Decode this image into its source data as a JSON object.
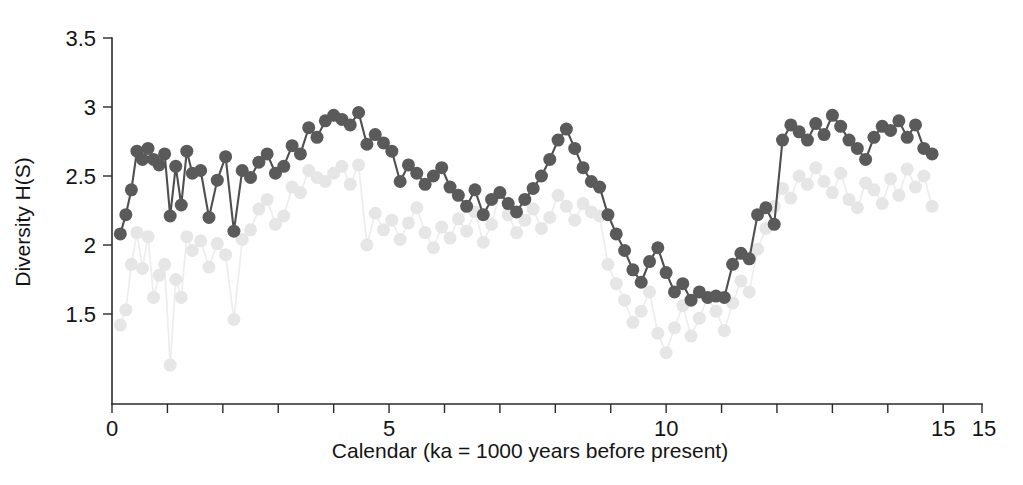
{
  "figure": {
    "title": "",
    "background_color": "#ffffff"
  },
  "axes": {
    "y_title": "Diversity H(S)",
    "x_title": "Calendar (ka = 1000 years before present)",
    "y_ticks": [
      "1.5",
      "2",
      "2.5",
      "3",
      "3.5"
    ],
    "x_ticks": [
      "0",
      "5",
      "10",
      "15",
      "15"
    ]
  },
  "chart_data": {
    "type": "scatter",
    "title": "",
    "xlabel": "Calendar (ka = 1000 years before present)",
    "ylabel": "Diversity H(S)",
    "xlim": [
      0,
      15.7
    ],
    "ylim": [
      1.05,
      3.5
    ],
    "x_tick_values": [
      0,
      1,
      2,
      3,
      4,
      5,
      6,
      7,
      8,
      9,
      10,
      11,
      12,
      13,
      14,
      15
    ],
    "x_tick_labels": [
      "0",
      "",
      "",
      "",
      "",
      "5",
      "",
      "",
      "",
      "",
      "10",
      "",
      "",
      "",
      "",
      "15"
    ],
    "x_extra_tick_label": "15",
    "y_tick_values": [
      1.5,
      2.0,
      2.5,
      3.0,
      3.5
    ],
    "y_tick_labels": [
      "1.5",
      "2",
      "2.5",
      "3",
      "3.5"
    ],
    "grid": false,
    "legend": "none",
    "marker": "circle",
    "marker_size": 13,
    "connected": true,
    "series": [
      {
        "name": "secondary-diversity",
        "color": "#e6e6e6",
        "line_color": "#ededed",
        "zorder": 1,
        "x": [
          0.15,
          0.25,
          0.35,
          0.45,
          0.55,
          0.65,
          0.75,
          0.85,
          0.95,
          1.05,
          1.15,
          1.25,
          1.35,
          1.45,
          1.6,
          1.75,
          1.9,
          2.05,
          2.2,
          2.35,
          2.5,
          2.65,
          2.8,
          2.95,
          3.1,
          3.25,
          3.4,
          3.55,
          3.7,
          3.85,
          4.0,
          4.15,
          4.3,
          4.45,
          4.6,
          4.75,
          4.9,
          5.05,
          5.2,
          5.35,
          5.5,
          5.65,
          5.8,
          5.95,
          6.1,
          6.25,
          6.4,
          6.55,
          6.7,
          6.85,
          7.0,
          7.15,
          7.3,
          7.45,
          7.6,
          7.75,
          7.9,
          8.05,
          8.2,
          8.35,
          8.5,
          8.65,
          8.8,
          8.95,
          9.1,
          9.25,
          9.4,
          9.55,
          9.7,
          9.85,
          10.0,
          10.15,
          10.3,
          10.45,
          10.6,
          10.75,
          10.9,
          11.05,
          11.2,
          11.35,
          11.5,
          11.65,
          11.8,
          11.95,
          12.1,
          12.25,
          12.4,
          12.55,
          12.7,
          12.85,
          13.0,
          13.15,
          13.3,
          13.45,
          13.6,
          13.75,
          13.9,
          14.05,
          14.2,
          14.35,
          14.5,
          14.65,
          14.8
        ],
        "y": [
          1.42,
          1.53,
          1.86,
          2.09,
          1.83,
          2.06,
          1.62,
          1.78,
          1.86,
          1.13,
          1.75,
          1.62,
          2.06,
          1.96,
          2.03,
          1.84,
          2.01,
          1.93,
          1.46,
          2.04,
          2.11,
          2.26,
          2.33,
          2.15,
          2.21,
          2.42,
          2.38,
          2.54,
          2.49,
          2.46,
          2.52,
          2.57,
          2.44,
          2.58,
          2.0,
          2.23,
          2.11,
          2.18,
          2.04,
          2.16,
          2.27,
          2.09,
          1.98,
          2.13,
          2.05,
          2.19,
          2.1,
          2.24,
          2.02,
          2.15,
          2.38,
          2.22,
          2.09,
          2.18,
          2.26,
          2.12,
          2.2,
          2.36,
          2.28,
          2.18,
          2.3,
          2.24,
          2.21,
          1.86,
          1.72,
          1.6,
          1.44,
          1.52,
          1.66,
          1.36,
          1.22,
          1.4,
          1.56,
          1.34,
          1.47,
          1.62,
          1.52,
          1.38,
          1.58,
          1.74,
          1.66,
          1.97,
          2.12,
          2.28,
          2.41,
          2.34,
          2.5,
          2.44,
          2.56,
          2.46,
          2.38,
          2.52,
          2.33,
          2.27,
          2.45,
          2.4,
          2.3,
          2.48,
          2.36,
          2.55,
          2.42,
          2.5,
          2.28
        ]
      },
      {
        "name": "primary-diversity",
        "color": "#5a5a5a",
        "line_color": "#4f4f4f",
        "zorder": 2,
        "x": [
          0.15,
          0.25,
          0.35,
          0.45,
          0.55,
          0.65,
          0.75,
          0.85,
          0.95,
          1.05,
          1.15,
          1.25,
          1.35,
          1.45,
          1.6,
          1.75,
          1.9,
          2.05,
          2.2,
          2.35,
          2.5,
          2.65,
          2.8,
          2.95,
          3.1,
          3.25,
          3.4,
          3.55,
          3.7,
          3.85,
          4.0,
          4.15,
          4.3,
          4.45,
          4.6,
          4.75,
          4.9,
          5.05,
          5.2,
          5.35,
          5.5,
          5.65,
          5.8,
          5.95,
          6.1,
          6.25,
          6.4,
          6.55,
          6.7,
          6.85,
          7.0,
          7.15,
          7.3,
          7.45,
          7.6,
          7.75,
          7.9,
          8.05,
          8.2,
          8.35,
          8.5,
          8.65,
          8.8,
          8.95,
          9.1,
          9.25,
          9.4,
          9.55,
          9.7,
          9.85,
          10.0,
          10.15,
          10.3,
          10.45,
          10.6,
          10.75,
          10.9,
          11.05,
          11.2,
          11.35,
          11.5,
          11.65,
          11.8,
          11.95,
          12.1,
          12.25,
          12.4,
          12.55,
          12.7,
          12.85,
          13.0,
          13.15,
          13.3,
          13.45,
          13.6,
          13.75,
          13.9,
          14.05,
          14.2,
          14.35,
          14.5,
          14.65,
          14.8
        ],
        "y": [
          2.08,
          2.22,
          2.4,
          2.68,
          2.62,
          2.7,
          2.62,
          2.58,
          2.66,
          2.21,
          2.57,
          2.29,
          2.68,
          2.52,
          2.54,
          2.2,
          2.47,
          2.64,
          2.1,
          2.54,
          2.49,
          2.6,
          2.66,
          2.52,
          2.57,
          2.72,
          2.66,
          2.85,
          2.78,
          2.9,
          2.94,
          2.91,
          2.87,
          2.96,
          2.73,
          2.8,
          2.74,
          2.68,
          2.46,
          2.58,
          2.52,
          2.44,
          2.5,
          2.56,
          2.42,
          2.36,
          2.28,
          2.4,
          2.22,
          2.33,
          2.38,
          2.3,
          2.24,
          2.33,
          2.41,
          2.5,
          2.62,
          2.76,
          2.84,
          2.7,
          2.56,
          2.46,
          2.42,
          2.22,
          2.08,
          1.96,
          1.82,
          1.73,
          1.88,
          1.98,
          1.8,
          1.66,
          1.72,
          1.6,
          1.66,
          1.62,
          1.63,
          1.62,
          1.86,
          1.94,
          1.9,
          2.22,
          2.27,
          2.15,
          2.76,
          2.87,
          2.82,
          2.76,
          2.88,
          2.8,
          2.94,
          2.86,
          2.76,
          2.7,
          2.62,
          2.78,
          2.86,
          2.83,
          2.9,
          2.78,
          2.87,
          2.7,
          2.66
        ]
      }
    ]
  }
}
